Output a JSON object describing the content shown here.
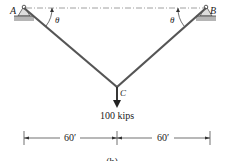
{
  "figure": {
    "support_a_label": "A",
    "support_b_label": "B",
    "joint_c_label": "C",
    "angle_a_label": "θ",
    "angle_b_label": "θ",
    "load_label": "100 kips",
    "dim_left_label": "60′",
    "dim_right_label": "60′",
    "caption_partial": "(b)",
    "colors": {
      "cable": "#555555",
      "support": "#8a8a8a",
      "line": "#222222",
      "reference": "#888888"
    }
  }
}
